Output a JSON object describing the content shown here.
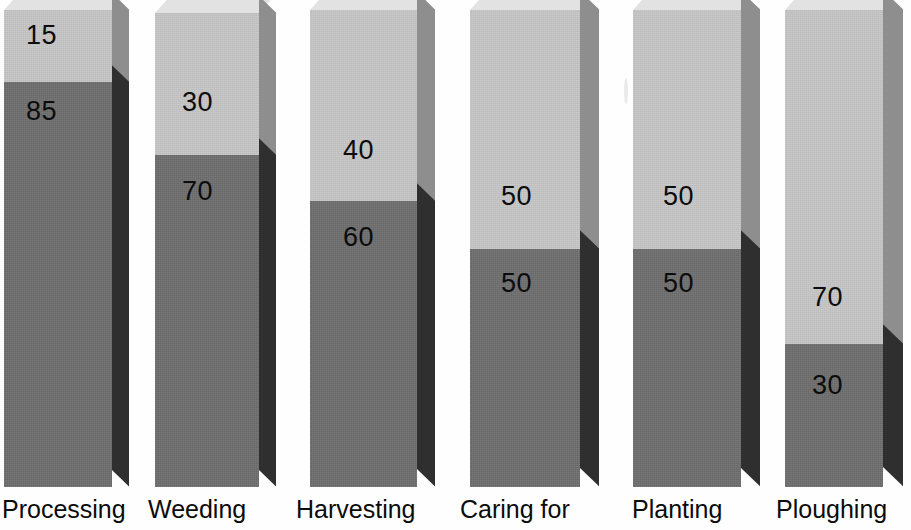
{
  "chart_data": {
    "type": "bar",
    "title": "",
    "subtitle": "",
    "xlabel": "",
    "ylabel": "",
    "stacked": true,
    "percent_stacked": true,
    "grid": false,
    "legend_position": "none",
    "ylim": [
      0,
      100
    ],
    "style": "3d-stacked-columns",
    "categories": [
      "Processing",
      "Weeding",
      "Harvesting",
      "Caring for",
      "Planting",
      "Ploughing"
    ],
    "series": [
      {
        "name": "upper-segment",
        "color": "#c6c6c6",
        "values": [
          15,
          30,
          40,
          50,
          50,
          70
        ]
      },
      {
        "name": "lower-segment",
        "color": "#6e6e6e",
        "values": [
          85,
          70,
          60,
          50,
          50,
          30
        ]
      }
    ],
    "colors": {
      "upper_face": "#c6c6c6",
      "lower_face": "#6e6e6e",
      "upper_side": "#8e8e8e",
      "lower_side": "#2f2f2f",
      "top_face": "#e2e2e2",
      "background": "#ffffff",
      "label_text": "#0c0c0c"
    }
  },
  "bars": [
    {
      "category": "Processing",
      "label_x": 2,
      "x": 4,
      "width": 108,
      "depth": 17,
      "top": 10,
      "bottom": 487,
      "split_pct": 15,
      "upper_value": "15",
      "lower_value": "85",
      "upper_label_x": 26,
      "upper_label_y": 22,
      "lower_label_x": 26,
      "lower_label_y": 98
    },
    {
      "category": "Weeding",
      "label_x": 148,
      "x": 155,
      "width": 104,
      "depth": 17,
      "top": 13,
      "bottom": 487,
      "split_pct": 30,
      "upper_value": "30",
      "lower_value": "70",
      "upper_label_x": 182,
      "upper_label_y": 89,
      "lower_label_x": 182,
      "lower_label_y": 178
    },
    {
      "category": "Harvesting",
      "label_x": 296,
      "x": 310,
      "width": 107,
      "depth": 18,
      "top": 10,
      "bottom": 487,
      "split_pct": 40,
      "upper_value": "40",
      "lower_value": "60",
      "upper_label_x": 343,
      "upper_label_y": 137,
      "lower_label_x": 343,
      "lower_label_y": 224
    },
    {
      "category": "Caring for",
      "label_x": 460,
      "x": 470,
      "width": 110,
      "depth": 19,
      "top": 10,
      "bottom": 487,
      "split_pct": 50,
      "upper_value": "50",
      "lower_value": "50",
      "upper_label_x": 501,
      "upper_label_y": 183,
      "lower_label_x": 501,
      "lower_label_y": 270
    },
    {
      "category": "Planting",
      "label_x": 632,
      "x": 633,
      "width": 108,
      "depth": 19,
      "top": 10,
      "bottom": 487,
      "split_pct": 50,
      "upper_value": "50",
      "lower_value": "50",
      "upper_label_x": 663,
      "upper_label_y": 183,
      "lower_label_x": 663,
      "lower_label_y": 270
    },
    {
      "category": "Ploughing",
      "label_x": 776,
      "x": 785,
      "width": 98,
      "depth": 20,
      "top": 10,
      "bottom": 487,
      "split_pct": 70,
      "upper_value": "70",
      "lower_value": "30",
      "upper_label_x": 812,
      "upper_label_y": 284,
      "lower_label_x": 812,
      "lower_label_y": 372
    }
  ]
}
